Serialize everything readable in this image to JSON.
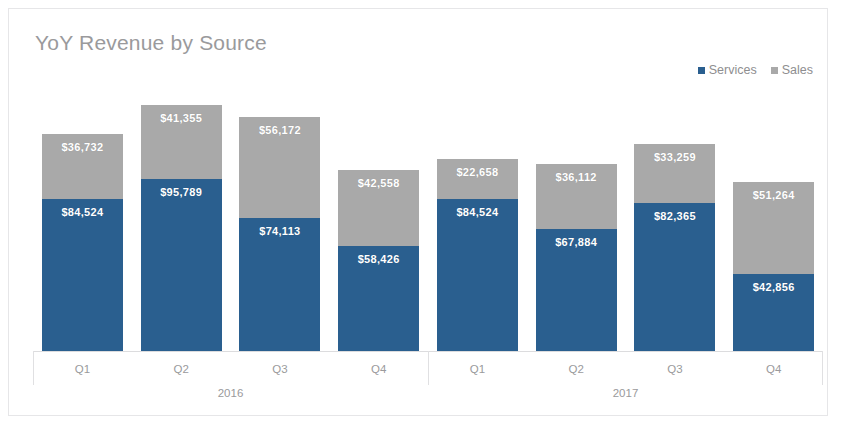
{
  "chart_data": {
    "type": "bar",
    "subtype": "stacked",
    "title": "YoY Revenue by Source",
    "xlabel": "",
    "ylabel": "",
    "grid": false,
    "axis_visible": true,
    "ylim": [
      0,
      137144
    ],
    "legend_position": "top-right",
    "categories": [
      "Q1",
      "Q2",
      "Q3",
      "Q4",
      "Q1",
      "Q2",
      "Q3",
      "Q4"
    ],
    "group_labels": [
      "2016",
      "2017"
    ],
    "groups": [
      {
        "year": "2016",
        "quarters": [
          {
            "label": "Q1",
            "services": 84524,
            "sales": 36732,
            "services_label": "$84,524",
            "sales_label": "$36,732"
          },
          {
            "label": "Q2",
            "services": 95789,
            "sales": 41355,
            "services_label": "$95,789",
            "sales_label": "$41,355"
          },
          {
            "label": "Q3",
            "services": 74113,
            "sales": 56172,
            "services_label": "$74,113",
            "sales_label": "$56,172"
          },
          {
            "label": "Q4",
            "services": 58426,
            "sales": 42558,
            "services_label": "$58,426",
            "sales_label": "$42,558"
          }
        ]
      },
      {
        "year": "2017",
        "quarters": [
          {
            "label": "Q1",
            "services": 84524,
            "sales": 22658,
            "services_label": "$84,524",
            "sales_label": "$22,658"
          },
          {
            "label": "Q2",
            "services": 67884,
            "sales": 36112,
            "services_label": "$67,884",
            "sales_label": "$36,112"
          },
          {
            "label": "Q3",
            "services": 82365,
            "sales": 33259,
            "services_label": "$82,365",
            "sales_label": "$33,259"
          },
          {
            "label": "Q4",
            "services": 42856,
            "sales": 51264,
            "services_label": "$42,856",
            "sales_label": "$51,264"
          }
        ]
      }
    ],
    "series": [
      {
        "name": "Services",
        "color": "#2a5f8f",
        "values": [
          84524,
          95789,
          74113,
          58426,
          84524,
          67884,
          82365,
          42856
        ]
      },
      {
        "name": "Sales",
        "color": "#a9a9a9",
        "values": [
          36732,
          41355,
          56172,
          42558,
          22658,
          36112,
          33259,
          51264
        ]
      }
    ]
  },
  "legend": {
    "items": [
      {
        "label": "Services",
        "color": "#2a5f8f"
      },
      {
        "label": "Sales",
        "color": "#a9a9a9"
      }
    ]
  },
  "colors": {
    "services": "#2a5f8f",
    "sales": "#a9a9a9",
    "title_text": "#9a9a9c",
    "axis_text": "#9a9a9c",
    "frame_border": "#e6e6e8",
    "background": "#ffffff"
  }
}
